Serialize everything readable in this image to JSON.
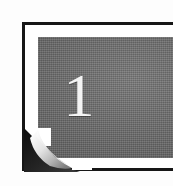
{
  "graphic": {
    "name": "chapter-number-plate",
    "kind": "decorative-chapter-heading",
    "numeral": "1",
    "numeral_color": "#f4f4f4",
    "block_color": "#6d6d6d",
    "rule_color": "#161616",
    "page_color": "#ffffff",
    "curl": {
      "position": "bottom-left",
      "shadow_color": "#1e1e1e",
      "highlight_color": "#f2f2f2",
      "midtone_color": "#9c9c9c"
    }
  }
}
